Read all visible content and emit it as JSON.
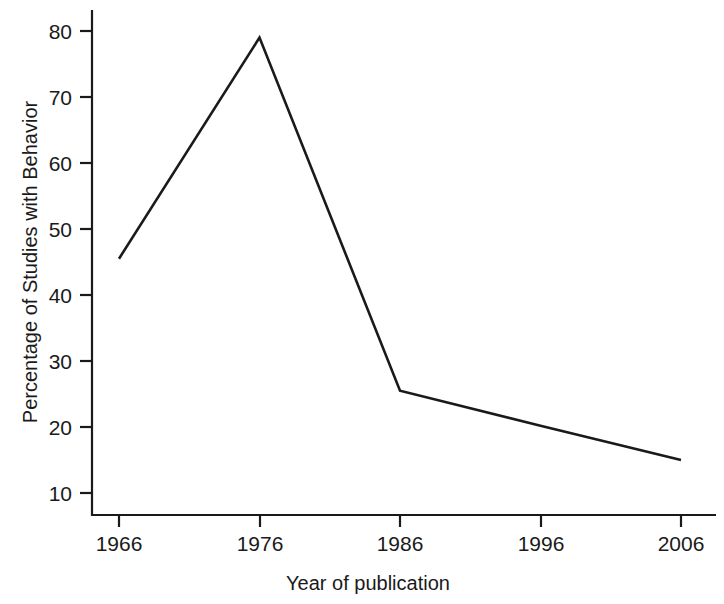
{
  "chart_data": {
    "type": "line",
    "title": "",
    "subtitle": "",
    "xlabel": "Year of publication",
    "ylabel": "Percentage of Studies with Behavior",
    "x": [
      1966,
      1976,
      1986,
      1996,
      2006
    ],
    "values": [
      45.5,
      79,
      25.5,
      20.2,
      15
    ],
    "series": [
      {
        "name": "Percentage of Studies with Behavior",
        "values": [
          45.5,
          79,
          25.5,
          20.2,
          15
        ],
        "color": "#1a1a1a"
      }
    ],
    "xticks": [
      1966,
      1976,
      1986,
      1996,
      2006
    ],
    "xtick_labels": [
      "1966",
      "1976",
      "1986",
      "1996",
      "2006"
    ],
    "yticks": [
      10,
      20,
      30,
      40,
      50,
      60,
      70,
      80
    ],
    "ytick_labels": [
      "10",
      "20",
      "30",
      "40",
      "50",
      "60",
      "70",
      "80"
    ],
    "xlim": [
      1966,
      2006
    ],
    "ylim": [
      6,
      83
    ],
    "grid": false,
    "legend": false,
    "legend_position": "none",
    "markers": false,
    "background_color": "#ffffff",
    "line_color": "#1a1a1a",
    "axis_color": "#1a1a1a",
    "annotations": []
  },
  "axes": {
    "y_title": "Percentage of Studies with Behavior",
    "x_title": "Year of publication",
    "y_ticks": [
      {
        "label": "80"
      },
      {
        "label": "70"
      },
      {
        "label": "60"
      },
      {
        "label": "50"
      },
      {
        "label": "40"
      },
      {
        "label": "30"
      },
      {
        "label": "20"
      },
      {
        "label": "10"
      }
    ],
    "x_ticks": [
      {
        "label": "1966"
      },
      {
        "label": "1976"
      },
      {
        "label": "1986"
      },
      {
        "label": "1996"
      },
      {
        "label": "2006"
      }
    ]
  }
}
